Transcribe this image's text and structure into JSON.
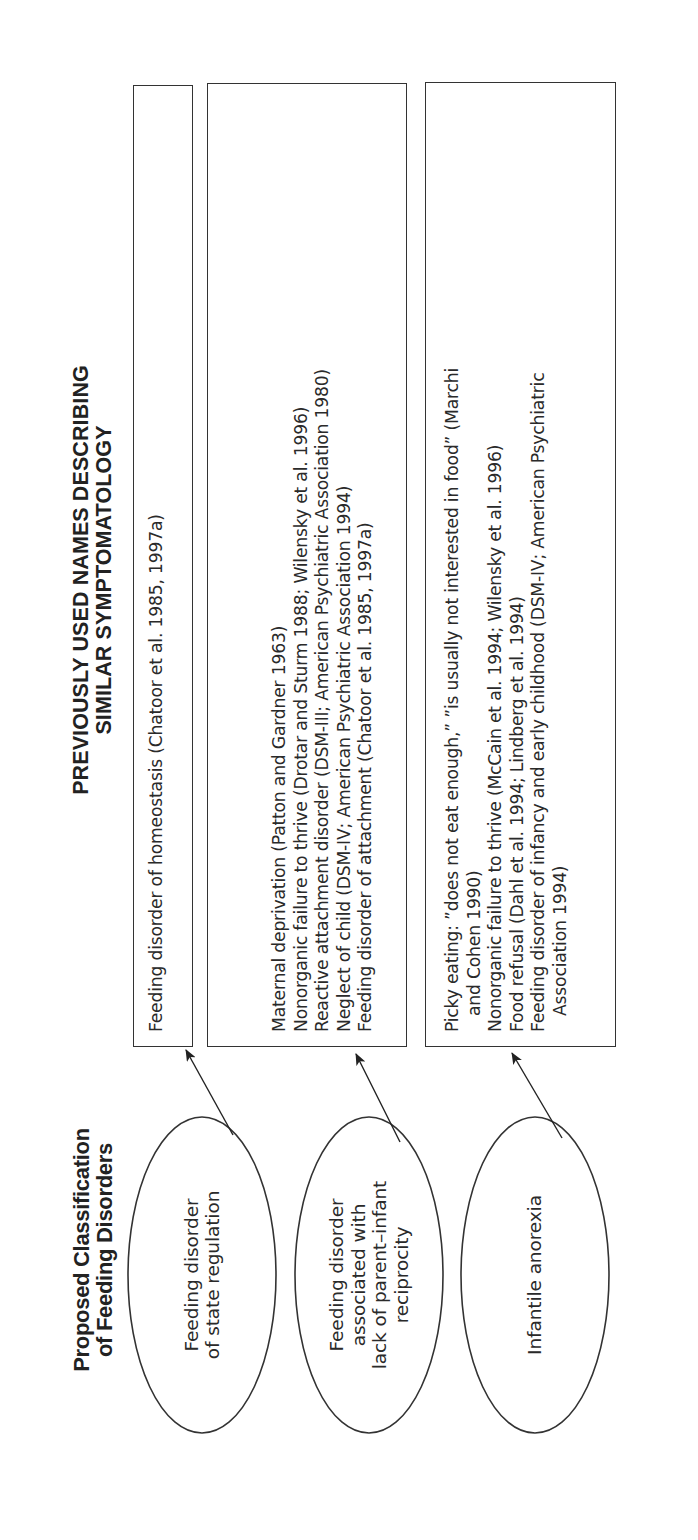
{
  "left_title": "Proposed Classification of Feeding Disorders",
  "left_title_lines": [
    "Proposed Classification",
    "of Feeding Disorders"
  ],
  "right_title": "PREVIOUSLY USED NAMES DESCRIBING SIMILAR SYMPTOMATOLOGY",
  "right_title_lines": [
    "PREVIOUSLY USED NAMES DESCRIBING",
    "SIMILAR SYMPTOMATOLOGY"
  ],
  "classifications": [
    {
      "label_lines": [
        "Feeding disorder",
        "of state regulation"
      ],
      "previous_names": [
        {
          "text": "Feeding disorder of homeostasis (Chatoor et al. 1985, 1997a)",
          "indent": false
        }
      ]
    },
    {
      "label_lines": [
        "Feeding disorder",
        "associated with",
        "lack of parent–infant",
        "reciprocity"
      ],
      "previous_names": [
        {
          "text": "Maternal deprivation (Patton and Gardner 1963)",
          "indent": false
        },
        {
          "text": "Nonorganic failure to thrive (Drotar and Sturm 1988; Wilensky et al. 1996)",
          "indent": false
        },
        {
          "text": "Reactive attachment disorder (DSM-III; American Psychiatric Association 1980)",
          "indent": false
        },
        {
          "text": "Neglect of child (DSM-IV; American Psychiatric Association 1994)",
          "indent": false
        },
        {
          "text": "Feeding disorder of attachment (Chatoor et al. 1985, 1997a)",
          "indent": false
        }
      ]
    },
    {
      "label_lines": [
        "Infantile anorexia"
      ],
      "previous_names": [
        {
          "text": "Picky eating: ”does not eat enough,” ”is usually not interested in food” (Marchi",
          "indent": false
        },
        {
          "text": "and Cohen 1990)",
          "indent": true
        },
        {
          "text": "Nonorganic failure to thrive (McCain et al. 1994; Wilensky et al. 1996)",
          "indent": false
        },
        {
          "text": "Food refusal (Dahl et al. 1994; Lindberg et al. 1994)",
          "indent": false
        },
        {
          "text": "Feeding disorder of infancy and early childhood (DSM-IV; American Psychiatric",
          "indent": false
        },
        {
          "text": "Association 1994)",
          "indent": true
        }
      ]
    }
  ],
  "colors": {
    "line": "#333333",
    "text": "#2a2a2a",
    "background": "#ffffff"
  }
}
